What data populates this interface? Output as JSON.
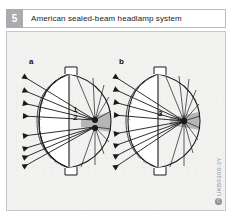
{
  "header": {
    "figure_number": "5",
    "title": "American sealed-beam headlamp system"
  },
  "figure": {
    "panels": [
      {
        "letter": "a",
        "description": "sealed-beam lamp with two filaments",
        "callouts": [
          {
            "id": "1",
            "label": "1"
          },
          {
            "id": "2",
            "label": "2"
          }
        ]
      },
      {
        "letter": "b",
        "description": "sealed-beam lamp with single filament",
        "callouts": [
          {
            "id": "3",
            "label": "3"
          }
        ]
      }
    ],
    "colors": {
      "figure_background": "#f2f2f1",
      "frame_border": "#c6c8ca",
      "number_badge": "#a9abad",
      "line": "#1a1a1a",
      "lens_fill": "#ffffff",
      "shaded_wedge": "#b4b6b8",
      "credit_text": "#8d8f91"
    }
  },
  "credit": {
    "code": "UKB0300-3Y",
    "mark": "©"
  }
}
